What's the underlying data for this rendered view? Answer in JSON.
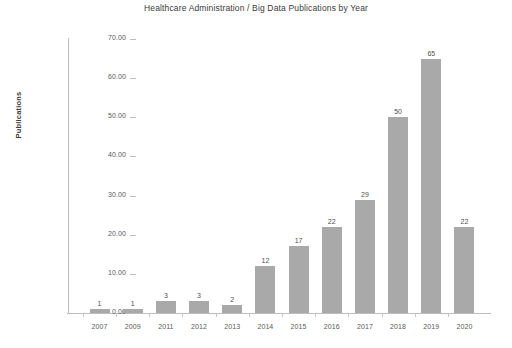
{
  "chart_data": {
    "type": "bar",
    "title": "Healthcare Administration / Big Data Publications by Year",
    "xlabel": "",
    "ylabel": "Publications",
    "categories": [
      "2007",
      "2009",
      "2011",
      "2012",
      "2013",
      "2014",
      "2015",
      "2016",
      "2017",
      "2018",
      "2019",
      "2020"
    ],
    "values": [
      1,
      1,
      3,
      3,
      2,
      12,
      17,
      22,
      29,
      50,
      65,
      22
    ],
    "value_labels": [
      "1",
      "1",
      "3",
      "3",
      "2",
      "12",
      "17",
      "22",
      "29",
      "50",
      "65",
      "22"
    ],
    "ylim": [
      0,
      70
    ],
    "ytick_values": [
      0,
      10,
      20,
      30,
      40,
      50,
      60,
      70
    ],
    "ytick_labels": [
      "0.00",
      "10.00",
      "20.00",
      "30.00",
      "40.00",
      "50.00",
      "60.00",
      "70.00"
    ],
    "grid": false,
    "legend": false,
    "legend_position": "none",
    "bar_color": "#a9a9a9",
    "axis_color": "#bdbdbd",
    "text_color": "#4a4a4a",
    "background_color": "#ffffff"
  }
}
